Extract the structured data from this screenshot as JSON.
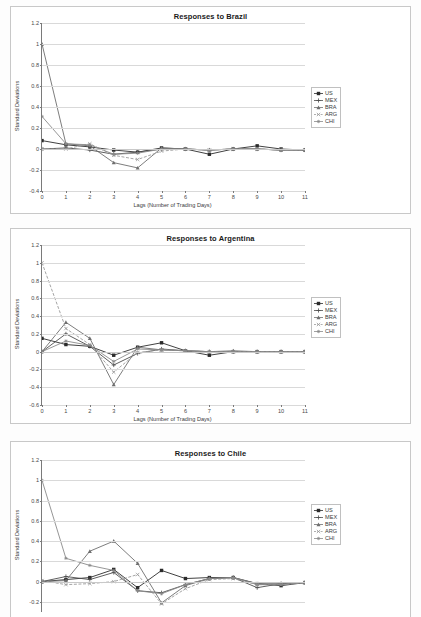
{
  "figure": {
    "ylabel": "Standard Deviations",
    "xlabel": "Lags (Number of Trading Days)",
    "legend_entries": [
      {
        "key": "US",
        "label": "US",
        "color": "#2b2b2b",
        "dash": "none",
        "marker": "square"
      },
      {
        "key": "MEX",
        "label": "MEX",
        "color": "#4d4d4d",
        "dash": "none",
        "marker": "plus"
      },
      {
        "key": "BRA",
        "label": "BRA",
        "color": "#6e6e6e",
        "dash": "none",
        "marker": "triangle"
      },
      {
        "key": "ARG",
        "label": "ARG",
        "color": "#9a9a9a",
        "dash": "dash",
        "marker": "cross"
      },
      {
        "key": "CHI",
        "label": "CHI",
        "color": "#8a8a8a",
        "dash": "none",
        "marker": "star"
      }
    ]
  },
  "chart_data": [
    {
      "type": "line",
      "id": "brazil",
      "title": "Responses to Brazil",
      "xlabel": "Lags (Number of Trading Days)",
      "ylabel": "Standard Deviations",
      "x": [
        0,
        1,
        2,
        3,
        4,
        5,
        6,
        7,
        8,
        9,
        10,
        11
      ],
      "xticklabels": [
        "0",
        "1",
        "2",
        "3",
        "4",
        "5",
        "6",
        "7",
        "8",
        "9",
        "10",
        "11"
      ],
      "ylim": [
        -0.4,
        1.2
      ],
      "yticks": [
        1.2,
        1,
        0.8,
        0.6,
        0.4,
        0.2,
        0,
        -0.2,
        -0.4
      ],
      "yticklabels": [
        "1.2",
        "1",
        "0.8",
        "0.6",
        "0.4",
        "0.2",
        "0",
        "-0.2",
        "-0.4"
      ],
      "grid": true,
      "legend_position": "right",
      "series": [
        {
          "name": "US",
          "values": [
            0.08,
            0.04,
            0.02,
            -0.01,
            -0.03,
            0.01,
            0.0,
            -0.05,
            0.0,
            0.03,
            0.0,
            -0.01
          ]
        },
        {
          "name": "MEX",
          "values": [
            0.0,
            0.01,
            -0.01,
            -0.05,
            -0.03,
            0.0,
            0.0,
            -0.01,
            0.0,
            0.0,
            -0.01,
            -0.01
          ]
        },
        {
          "name": "BRA",
          "values": [
            1.0,
            0.05,
            0.03,
            -0.13,
            -0.18,
            0.01,
            0.0,
            -0.01,
            0.0,
            0.0,
            -0.01,
            -0.01
          ]
        },
        {
          "name": "ARG",
          "values": [
            0.0,
            0.0,
            0.05,
            -0.06,
            -0.1,
            -0.02,
            0.0,
            -0.01,
            0.0,
            0.0,
            -0.01,
            -0.01
          ]
        },
        {
          "name": "CHI",
          "values": [
            0.31,
            0.05,
            0.04,
            -0.05,
            -0.04,
            0.0,
            0.0,
            -0.01,
            0.0,
            0.0,
            -0.01,
            -0.01
          ]
        }
      ]
    },
    {
      "type": "line",
      "id": "argentina",
      "title": "Responses to Argentina",
      "xlabel": "Lags (Number of Trading Days)",
      "ylabel": "Standard Deviations",
      "x": [
        0,
        1,
        2,
        3,
        4,
        5,
        6,
        7,
        8,
        9,
        10,
        11
      ],
      "xticklabels": [
        "0",
        "1",
        "2",
        "3",
        "4",
        "5",
        "6",
        "7",
        "8",
        "9",
        "10",
        "11"
      ],
      "ylim": [
        -0.6,
        1.2
      ],
      "yticks": [
        1.2,
        1,
        0.8,
        0.6,
        0.4,
        0.2,
        0,
        -0.2,
        -0.4,
        -0.6
      ],
      "yticklabels": [
        "1.2",
        "1",
        "0.8",
        "0.6",
        "0.4",
        "0.2",
        "0",
        "-0.2",
        "-0.4",
        "-0.6"
      ],
      "grid": true,
      "legend_position": "right",
      "series": [
        {
          "name": "US",
          "values": [
            0.15,
            0.08,
            0.06,
            -0.04,
            0.05,
            0.1,
            0.01,
            -0.04,
            0.0,
            0.0,
            0.0,
            0.0
          ]
        },
        {
          "name": "MEX",
          "values": [
            0.0,
            0.2,
            0.06,
            -0.15,
            -0.02,
            0.03,
            0.01,
            0.0,
            0.0,
            0.0,
            0.0,
            0.0
          ]
        },
        {
          "name": "BRA",
          "values": [
            0.0,
            0.33,
            0.15,
            -0.37,
            0.05,
            0.02,
            0.01,
            0.0,
            0.01,
            0.0,
            0.0,
            0.0
          ]
        },
        {
          "name": "ARG",
          "values": [
            1.0,
            0.26,
            0.08,
            -0.23,
            -0.01,
            0.02,
            0.01,
            0.0,
            0.0,
            0.0,
            0.0,
            0.0
          ]
        },
        {
          "name": "CHI",
          "values": [
            0.0,
            0.12,
            0.07,
            -0.11,
            0.03,
            0.02,
            0.01,
            0.0,
            0.0,
            0.0,
            0.0,
            0.0
          ]
        }
      ]
    },
    {
      "type": "line",
      "id": "chile",
      "title": "Responses to Chile",
      "xlabel": "Lags (Number of Trading Days)",
      "ylabel": "Standard Deviations",
      "x": [
        0,
        1,
        2,
        3,
        4,
        5,
        6,
        7,
        8,
        9,
        10,
        11
      ],
      "xticklabels": [
        "0",
        "1",
        "2",
        "3",
        "4",
        "5",
        "6",
        "7",
        "8",
        "9",
        "10",
        "11"
      ],
      "ylim": [
        -0.3,
        1.2
      ],
      "yticks": [
        1.2,
        1,
        0.8,
        0.6,
        0.4,
        0.2,
        0,
        -0.2
      ],
      "yticklabels": [
        "1.2",
        "1",
        "0.8",
        "0.6",
        "0.4",
        "0.2",
        "0",
        "-0.2"
      ],
      "grid": true,
      "legend_position": "right",
      "series": [
        {
          "name": "US",
          "values": [
            0.0,
            0.02,
            0.04,
            0.12,
            -0.06,
            0.11,
            0.03,
            0.04,
            0.04,
            -0.02,
            -0.04,
            -0.01
          ]
        },
        {
          "name": "MEX",
          "values": [
            0.0,
            0.05,
            0.02,
            0.09,
            -0.09,
            -0.11,
            -0.03,
            0.03,
            0.04,
            -0.06,
            -0.02,
            -0.01
          ]
        },
        {
          "name": "BRA",
          "values": [
            0.0,
            0.01,
            0.3,
            0.4,
            0.18,
            -0.21,
            -0.04,
            0.03,
            0.04,
            -0.02,
            -0.02,
            -0.01
          ]
        },
        {
          "name": "ARG",
          "values": [
            0.01,
            -0.03,
            -0.02,
            0.0,
            0.07,
            -0.22,
            -0.07,
            0.02,
            0.03,
            -0.03,
            -0.03,
            -0.01
          ]
        },
        {
          "name": "CHI",
          "values": [
            1.0,
            0.23,
            0.16,
            0.11,
            -0.09,
            -0.12,
            -0.03,
            0.03,
            0.04,
            -0.03,
            -0.03,
            -0.01
          ]
        }
      ]
    }
  ]
}
